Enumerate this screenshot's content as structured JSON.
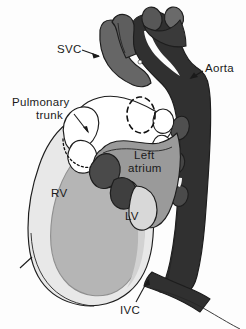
{
  "figure": {
    "background_color": "#fdfdfd",
    "width": 246,
    "height": 329
  },
  "labels": {
    "svc": "SVC",
    "aorta": "Aorta",
    "pulmonary_trunk_line1": "Pulmonary",
    "pulmonary_trunk_line2": "trunk",
    "left_atrium_line1": "Left",
    "left_atrium_line2": "atrium",
    "rv": "RV",
    "lv": "LV",
    "ivc": "IVC"
  },
  "colors": {
    "aorta_dark": "#303030",
    "svc_gray": "#666666",
    "left_atrium_gray": "#9a9a9a",
    "lv_cavity_gray": "#b5b5b5",
    "rv_wall_light": "#e8e8e8",
    "myocardium_mid": "#c8c8c8",
    "appendage_white": "#ffffff",
    "dark_accent": "#4a4a4a",
    "outline": "#1d1d1d",
    "text": "#1a1a1a"
  },
  "structures": [
    {
      "name": "superior-vena-cava",
      "abbrev": "SVC",
      "shade": "medium-gray"
    },
    {
      "name": "aorta",
      "abbrev": "Aorta",
      "shade": "dark"
    },
    {
      "name": "pulmonary-trunk",
      "abbrev": "Pulmonary trunk",
      "shade": "white"
    },
    {
      "name": "left-atrium",
      "abbrev": "Left atrium",
      "shade": "medium-gray"
    },
    {
      "name": "right-ventricle",
      "abbrev": "RV",
      "shade": "light-gray"
    },
    {
      "name": "left-ventricle",
      "abbrev": "LV",
      "shade": "mid-gray"
    },
    {
      "name": "inferior-vena-cava",
      "abbrev": "IVC",
      "shade": "dark"
    }
  ]
}
